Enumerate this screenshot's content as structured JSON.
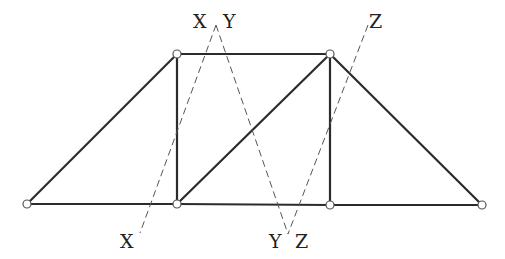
{
  "diagram": {
    "type": "truss-with-section-cuts",
    "colors": {
      "member": "#2b2b2b",
      "section_line": "#555555",
      "joint_fill": "#ffffff",
      "joint_stroke": "#555555",
      "label": "#222222"
    },
    "joints": [
      {
        "id": "bottom-left",
        "x": 27,
        "y": 204
      },
      {
        "id": "bottom-mid-left",
        "x": 177,
        "y": 204
      },
      {
        "id": "bottom-mid-right",
        "x": 330,
        "y": 205
      },
      {
        "id": "bottom-right",
        "x": 482,
        "y": 205
      },
      {
        "id": "top-left",
        "x": 177,
        "y": 54
      },
      {
        "id": "top-right",
        "x": 330,
        "y": 54
      }
    ],
    "members": [
      {
        "id": "bottom-chord-1",
        "from": "bottom-left",
        "to": "bottom-mid-left"
      },
      {
        "id": "bottom-chord-2",
        "from": "bottom-mid-left",
        "to": "bottom-mid-right"
      },
      {
        "id": "bottom-chord-3",
        "from": "bottom-mid-right",
        "to": "bottom-right"
      },
      {
        "id": "top-chord",
        "from": "top-left",
        "to": "top-right"
      },
      {
        "id": "left-end-diagonal",
        "from": "bottom-left",
        "to": "top-left"
      },
      {
        "id": "left-vertical",
        "from": "bottom-mid-left",
        "to": "top-left"
      },
      {
        "id": "center-diagonal",
        "from": "bottom-mid-left",
        "to": "top-right"
      },
      {
        "id": "right-vertical",
        "from": "bottom-mid-right",
        "to": "top-right"
      },
      {
        "id": "right-end-diagonal",
        "from": "top-right",
        "to": "bottom-right"
      }
    ],
    "section_lines": [
      {
        "id": "section-x",
        "x1": 216,
        "y1": 25,
        "x2": 140,
        "y2": 233
      },
      {
        "id": "section-y",
        "x1": 216,
        "y1": 25,
        "x2": 288,
        "y2": 234
      },
      {
        "id": "section-z",
        "x1": 368,
        "y1": 25,
        "x2": 288,
        "y2": 234
      }
    ],
    "labels": [
      {
        "id": "label-x-top",
        "text": "X",
        "x": 193,
        "y": 28
      },
      {
        "id": "label-y-top",
        "text": "Y",
        "x": 223,
        "y": 28
      },
      {
        "id": "label-z-top",
        "text": "Z",
        "x": 369,
        "y": 28
      },
      {
        "id": "label-x-bottom",
        "text": "X",
        "x": 120,
        "y": 248
      },
      {
        "id": "label-y-bottom",
        "text": "Y",
        "x": 269,
        "y": 248
      },
      {
        "id": "label-z-bottom",
        "text": "Z",
        "x": 295,
        "y": 248
      }
    ]
  }
}
